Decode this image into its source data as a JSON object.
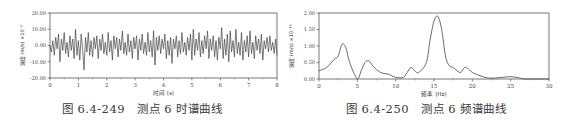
{
  "chart_data": [
    {
      "type": "line",
      "title": "",
      "caption_number": "图 6.4-249",
      "caption_text": "测点 6 时谱曲线",
      "xlabel": "时间 (s)",
      "ylabel": "速度 (m/s) ×10^-6",
      "y_exponent_label": "×10⁻⁶",
      "xlim": [
        0,
        8
      ],
      "ylim": [
        -20,
        20
      ],
      "x_ticks": [
        "0",
        "1",
        "2",
        "3",
        "4",
        "5",
        "6",
        "7",
        "8"
      ],
      "y_ticks": [
        "20.00",
        "10.00",
        "0.00",
        "-10.00",
        "-20.00"
      ],
      "grid": false,
      "series": [
        {
          "name": "velocity",
          "description": "random vibration time history, amplitude roughly ±10, min about -15 near t=1.2, max about 11 near t=6.0",
          "x": [
            0.0,
            0.05,
            0.1,
            0.15,
            0.2,
            0.25,
            0.3,
            0.35,
            0.4,
            0.45,
            0.5,
            0.55,
            0.6,
            0.65,
            0.7,
            0.75,
            0.8,
            0.85,
            0.9,
            0.95,
            1.0,
            1.05,
            1.1,
            1.15,
            1.2,
            1.25,
            1.3,
            1.35,
            1.4,
            1.45,
            1.5,
            1.55,
            1.6,
            1.65,
            1.7,
            1.75,
            1.8,
            1.85,
            1.9,
            1.95,
            2.0,
            2.05,
            2.1,
            2.15,
            2.2,
            2.25,
            2.3,
            2.35,
            2.4,
            2.45,
            2.5,
            2.55,
            2.6,
            2.65,
            2.7,
            2.75,
            2.8,
            2.85,
            2.9,
            2.95,
            3.0,
            3.05,
            3.1,
            3.15,
            3.2,
            3.25,
            3.3,
            3.35,
            3.4,
            3.45,
            3.5,
            3.55,
            3.6,
            3.65,
            3.7,
            3.75,
            3.8,
            3.85,
            3.9,
            3.95,
            4.0,
            4.05,
            4.1,
            4.15,
            4.2,
            4.25,
            4.3,
            4.35,
            4.4,
            4.45,
            4.5,
            4.55,
            4.6,
            4.65,
            4.7,
            4.75,
            4.8,
            4.85,
            4.9,
            4.95,
            5.0,
            5.05,
            5.1,
            5.15,
            5.2,
            5.25,
            5.3,
            5.35,
            5.4,
            5.45,
            5.5,
            5.55,
            5.6,
            5.65,
            5.7,
            5.75,
            5.8,
            5.85,
            5.9,
            5.95,
            6.0,
            6.05,
            6.1,
            6.15,
            6.2,
            6.25,
            6.3,
            6.35,
            6.4,
            6.45,
            6.5,
            6.55,
            6.6,
            6.65,
            6.7,
            6.75,
            6.8,
            6.85,
            6.9,
            6.95,
            7.0,
            7.05,
            7.1,
            7.15,
            7.2,
            7.25,
            7.3,
            7.35,
            7.4,
            7.45,
            7.5,
            7.55,
            7.6,
            7.65,
            7.7,
            7.75,
            7.8,
            7.85,
            7.9,
            7.95,
            8.0
          ],
          "y": [
            0,
            -4,
            3,
            -6,
            5,
            -2,
            7,
            -10,
            4,
            -3,
            8,
            -5,
            2,
            -7,
            6,
            -3,
            4,
            -8,
            10,
            -6,
            3,
            -9,
            7,
            -2,
            -15,
            5,
            -4,
            8,
            -6,
            3,
            -7,
            5,
            -2,
            6,
            -8,
            4,
            -3,
            7,
            -5,
            2,
            -6,
            8,
            -4,
            3,
            -9,
            6,
            -2,
            5,
            -7,
            4,
            -3,
            9,
            -5,
            2,
            -6,
            7,
            -4,
            3,
            -8,
            5,
            -2,
            6,
            -9,
            4,
            -3,
            7,
            -5,
            2,
            -6,
            8,
            -4,
            3,
            -7,
            9,
            -12,
            5,
            -3,
            6,
            -5,
            4,
            -2,
            7,
            -8,
            3,
            -6,
            5,
            -11,
            4,
            -2,
            6,
            -7,
            3,
            -5,
            8,
            -4,
            2,
            -6,
            5,
            -3,
            7,
            -9,
            10,
            -6,
            4,
            -3,
            8,
            -7,
            3,
            -5,
            6,
            -2,
            9,
            -8,
            4,
            -3,
            6,
            -7,
            3,
            -9,
            5,
            -2,
            11,
            -8,
            4,
            -6,
            7,
            -10,
            9,
            -4,
            3,
            -7,
            10,
            -5,
            2,
            -6,
            8,
            -9,
            3,
            -4,
            6,
            -7,
            9,
            -5,
            2,
            -8,
            6,
            -3,
            4,
            -5,
            7,
            -9,
            3,
            -2,
            5,
            -4,
            6,
            -3,
            2,
            -5,
            4,
            -6,
            3,
            -1,
            2,
            0
          ]
        }
      ]
    },
    {
      "type": "line",
      "title": "",
      "caption_number": "图 6.4-250",
      "caption_text": "测点 6 频谱曲线",
      "xlabel": "频率 (Hz)",
      "ylabel": "速度 (m/s) ×10^-12",
      "y_exponent_label": "×10⁻¹²",
      "xlim": [
        0,
        30
      ],
      "ylim": [
        0,
        2.0
      ],
      "x_ticks": [
        "0",
        "5",
        "10",
        "15",
        "20",
        "25",
        "30"
      ],
      "y_ticks": [
        "2.00",
        "1.50",
        "1.00",
        "0.50",
        "0.00"
      ],
      "grid": false,
      "series": [
        {
          "name": "spectrum",
          "x": [
            0,
            1,
            2,
            2.5,
            3,
            3.5,
            4,
            5,
            5.5,
            6,
            6.5,
            7,
            8,
            9,
            10,
            11,
            11.5,
            12,
            12.5,
            13,
            14,
            14.5,
            15,
            15.5,
            16,
            16.5,
            17,
            17.5,
            18,
            18.5,
            19,
            19.5,
            20,
            21,
            22,
            23,
            24,
            25,
            26,
            27,
            30
          ],
          "y": [
            0.25,
            0.35,
            0.6,
            0.7,
            1.05,
            0.95,
            0.5,
            0.0,
            0.25,
            0.5,
            0.55,
            0.4,
            0.2,
            0.15,
            0.05,
            0.05,
            0.2,
            0.35,
            0.25,
            0.2,
            0.5,
            1.2,
            1.75,
            1.9,
            1.5,
            0.7,
            0.4,
            0.35,
            0.25,
            0.2,
            0.35,
            0.3,
            0.2,
            0.1,
            0.03,
            0.03,
            0.05,
            0.07,
            0.04,
            0.0,
            0.0
          ]
        }
      ]
    }
  ]
}
